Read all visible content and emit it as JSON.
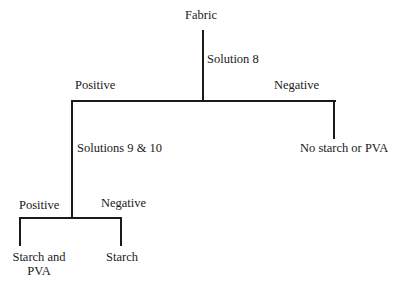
{
  "diagram": {
    "root": {
      "label": "Fabric"
    },
    "test1": {
      "label": "Solution 8"
    },
    "test1_positive": {
      "label": "Positive"
    },
    "test1_negative": {
      "label": "Negative"
    },
    "result_no_starch": {
      "label": "No starch or PVA"
    },
    "test2": {
      "label": "Solutions 9 & 10"
    },
    "test2_positive": {
      "label": "Positive"
    },
    "test2_negative": {
      "label": "Negative"
    },
    "result_starch_pva": {
      "line1": "Starch and",
      "line2": "PVA"
    },
    "result_starch": {
      "label": "Starch"
    }
  }
}
